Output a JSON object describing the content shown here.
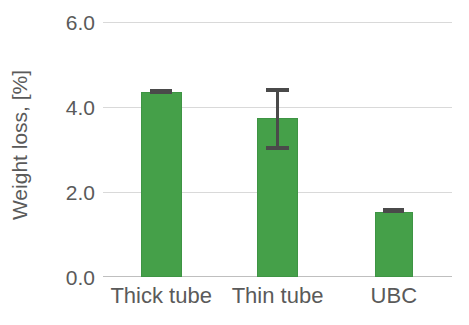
{
  "chart_data": {
    "type": "bar",
    "title": "",
    "xlabel": "",
    "ylabel": "Weight loss, [%]",
    "categories": [
      "Thick tube",
      "Thin tube",
      "UBC"
    ],
    "values": [
      4.35,
      3.75,
      1.53
    ],
    "errors_upper": [
      0.05,
      0.7,
      0.03
    ],
    "errors_lower": [
      0.05,
      0.76,
      0.03
    ],
    "ylim": [
      0.0,
      6.0
    ],
    "yticks": [
      "0.0",
      "2.0",
      "4.0",
      "6.0"
    ],
    "ytick_values": [
      0.0,
      2.0,
      4.0,
      6.0
    ],
    "grid": "horizontal",
    "legend": "none",
    "series": [
      {
        "name": "Weight loss",
        "values": [
          4.35,
          3.75,
          1.53
        ],
        "color": "#45a049"
      }
    ],
    "colors": {
      "bar": "#45a049",
      "bar_border": "#3e9444",
      "gridline": "#d9d9d9",
      "axis": "#bfbfbf",
      "text": "#5a5a5a",
      "errorbar": "#4a4a4a",
      "background": "#ffffff"
    }
  }
}
